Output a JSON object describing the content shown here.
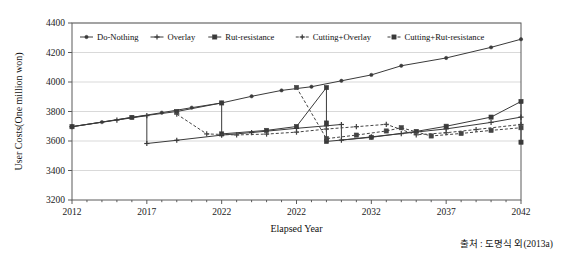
{
  "source": {
    "label": "출처 : 도명식 외(2013a)"
  },
  "chart_data": {
    "type": "line",
    "title": "",
    "xlabel": "Elapsed Year",
    "ylabel": "User Costs(One million won)",
    "xlim": [
      2012,
      2042
    ],
    "ylim": [
      3200,
      4400
    ],
    "xticks": [
      2012,
      2017,
      2022,
      2022,
      2032,
      2037,
      2042
    ],
    "xtick_positions": [
      2012,
      2017,
      2022,
      2027,
      2032,
      2037,
      2042
    ],
    "yticks": [
      3200,
      3400,
      3600,
      3800,
      4000,
      4200,
      4400
    ],
    "grid": "horizontal",
    "legend_position": "top-inside",
    "series": [
      {
        "name": "Do-Nothing",
        "style": "solid",
        "marker": "dot",
        "color": "#3a3a3a",
        "points": [
          [
            2012,
            3697
          ],
          [
            2014,
            3728
          ],
          [
            2016,
            3760
          ],
          [
            2018,
            3792
          ],
          [
            2020,
            3826
          ],
          [
            2022,
            3858
          ],
          [
            2024,
            3903
          ],
          [
            2026,
            3943
          ],
          [
            2028,
            3968
          ],
          [
            2030,
            4008
          ],
          [
            2032,
            4048
          ],
          [
            2034,
            4110
          ],
          [
            2037,
            4163
          ],
          [
            2040,
            4235
          ],
          [
            2042,
            4290
          ]
        ]
      },
      {
        "name": "Overlay",
        "style": "solid",
        "marker": "plus",
        "color": "#3a3a3a",
        "points": [
          [
            2012,
            3697
          ],
          [
            2015,
            3742
          ],
          [
            2017,
            3772
          ],
          [
            2017,
            3583
          ],
          [
            2019,
            3605
          ],
          [
            2022,
            3640
          ],
          [
            2024,
            3657
          ],
          [
            2027,
            3686
          ],
          [
            2029,
            3703
          ],
          [
            2030,
            3712
          ],
          [
            2030,
            3606
          ],
          [
            2032,
            3628
          ],
          [
            2034,
            3650
          ],
          [
            2037,
            3682
          ],
          [
            2040,
            3726
          ],
          [
            2042,
            3762
          ]
        ]
      },
      {
        "name": "Rut-resistance",
        "style": "solid",
        "marker": "square",
        "color": "#3a3a3a",
        "points": [
          [
            2012,
            3697
          ],
          [
            2016,
            3760
          ],
          [
            2019,
            3800
          ],
          [
            2022,
            3858
          ],
          [
            2022,
            3648
          ],
          [
            2025,
            3672
          ],
          [
            2027,
            3698
          ],
          [
            2029,
            3962
          ],
          [
            2029,
            3722
          ],
          [
            2029,
            3597
          ],
          [
            2032,
            3625
          ],
          [
            2035,
            3665
          ],
          [
            2037,
            3700
          ],
          [
            2040,
            3762
          ],
          [
            2042,
            3868
          ],
          [
            2042,
            3592
          ]
        ]
      },
      {
        "name": "Cutting+Overlay",
        "style": "dashed",
        "marker": "plus",
        "color": "#444444",
        "points": [
          [
            2019,
            3782
          ],
          [
            2021,
            3648
          ],
          [
            2023,
            3641
          ],
          [
            2025,
            3647
          ],
          [
            2027,
            3660
          ],
          [
            2029,
            3681
          ],
          [
            2031,
            3697
          ],
          [
            2033,
            3713
          ],
          [
            2035,
            3642
          ],
          [
            2037,
            3656
          ],
          [
            2039,
            3678
          ],
          [
            2042,
            3712
          ]
        ]
      },
      {
        "name": "Cutting+Rut-resistance",
        "style": "dashed",
        "marker": "square",
        "color": "#444444",
        "points": [
          [
            2027,
            3963
          ],
          [
            2029,
            3616
          ],
          [
            2031,
            3640
          ],
          [
            2033,
            3668
          ],
          [
            2034,
            3690
          ],
          [
            2036,
            3634
          ],
          [
            2038,
            3651
          ],
          [
            2040,
            3672
          ],
          [
            2042,
            3690
          ]
        ]
      }
    ],
    "legend": [
      {
        "label": "Do-Nothing",
        "style": "solid",
        "marker": "dot"
      },
      {
        "label": "Overlay",
        "style": "solid",
        "marker": "plus"
      },
      {
        "label": "Rut-resistance",
        "style": "solid",
        "marker": "square"
      },
      {
        "label": "Cutting+Overlay",
        "style": "dashed",
        "marker": "plus"
      },
      {
        "label": "Cutting+Rut-resistance",
        "style": "dashed",
        "marker": "square"
      }
    ]
  }
}
